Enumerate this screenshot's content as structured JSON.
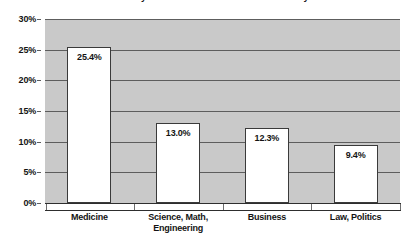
{
  "chart_data": {
    "type": "bar",
    "title": "in which you would most like to work someday",
    "xlabel": "",
    "ylabel": "",
    "categories": [
      "Medicine",
      "Science, Math, Engineering",
      "Business",
      "Law, Politics"
    ],
    "category_lines": [
      [
        "Medicine"
      ],
      [
        "Science, Math,",
        "Engineering"
      ],
      [
        "Business"
      ],
      [
        "Law, Politics"
      ]
    ],
    "values": [
      25.4,
      13.0,
      12.3,
      9.4
    ],
    "value_labels": [
      "25.4%",
      "13.0%",
      "12.3%",
      "9.4%"
    ],
    "ylim": [
      0,
      30
    ],
    "ytick_values": [
      30,
      25,
      20,
      15,
      10,
      5,
      0
    ],
    "ytick_labels": [
      "30%",
      "25%",
      "20%",
      "15%",
      "10%",
      "5%",
      "0%"
    ],
    "grid": true,
    "legend": "none",
    "plot_background_color": "#c9c9c9",
    "bar_fill_color": "#ffffff",
    "bar_border_color": "#3a3a3a",
    "gridline_color": "#5d5d5d",
    "text_color": "#141414"
  }
}
